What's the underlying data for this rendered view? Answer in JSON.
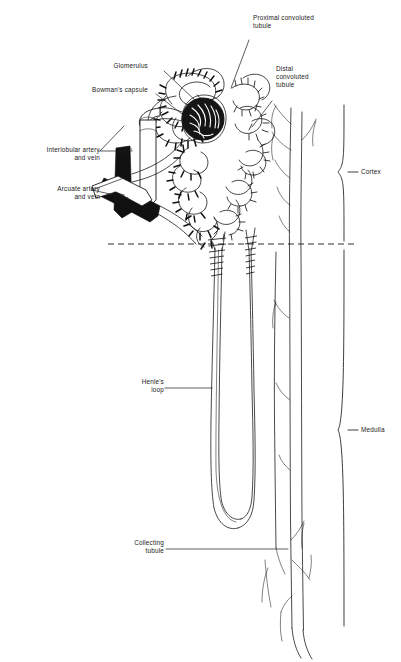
{
  "figure": {
    "width": 401,
    "height": 662,
    "background_color": "#ffffff",
    "ink_color": "#1a1a1a"
  },
  "labels": {
    "proximal_convoluted_tubule": "Proximal convoluted\ntubule",
    "glomerulus": "Glomerulus",
    "bowmans_capsule": "Bowman's capsule",
    "distal_convoluted_tubule": "Distal\nconvoluted\ntubule",
    "interlobular_artery_and_vein": "Interlobular artery\nand vein",
    "arcuate_artery_and_vein": "Arcuate artery\nand vein",
    "henles_loop": "Henle's\nloop",
    "collecting_tubule": "Collecting\ntubule",
    "cortex": "Cortex",
    "medulla": "Medulla"
  },
  "regions": {
    "cortex": {
      "label": "Cortex",
      "bracket_top": 105,
      "bracket_bottom": 243
    },
    "medulla": {
      "label": "Medulla",
      "bracket_top": 247,
      "bracket_bottom": 626
    },
    "boundary": {
      "style": "dashed",
      "y": 244,
      "x_start": 108,
      "x_end": 356
    }
  }
}
